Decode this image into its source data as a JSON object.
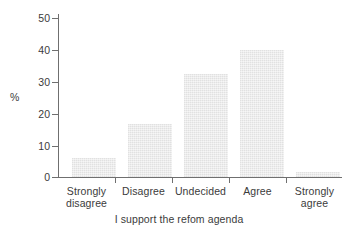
{
  "chart_data": {
    "type": "bar",
    "title": "",
    "subtitle": "",
    "xlabel": "I support the refom agenda",
    "ylabel": "%",
    "categories": [
      "Strongly disagree",
      "Disagree",
      "Undecided",
      "Agree",
      "Strongly agree"
    ],
    "values": [
      6,
      17,
      33,
      40.5,
      1.5
    ],
    "series": [
      {
        "name": "% of respondents",
        "values": [
          6,
          17,
          33,
          40.5,
          1.5
        ]
      }
    ],
    "ylim": [
      0,
      52
    ],
    "xlim": [
      0,
      5
    ],
    "yticks": [
      0,
      10,
      20,
      30,
      40,
      50
    ],
    "ytick_labels": [
      "0",
      "10",
      "20",
      "30",
      "40",
      "50"
    ],
    "grid": false,
    "legend": false,
    "legend_position": "none",
    "bar_color": "#ebebeb",
    "axis_color": "#6f6f6f",
    "text_color": "#3b3b3b",
    "background_color": "#ffffff",
    "annotations": []
  },
  "axes": {
    "y": {
      "title": "%",
      "ticks": [
        {
          "label": "50",
          "value": 50
        },
        {
          "label": "40",
          "value": 40
        },
        {
          "label": "30",
          "value": 30
        },
        {
          "label": "20",
          "value": 20
        },
        {
          "label": "10",
          "value": 10
        },
        {
          "label": "0",
          "value": 0
        }
      ]
    },
    "x": {
      "title": "I support the refom agenda",
      "categories": [
        {
          "line1": "Strongly",
          "line2": "disagree"
        },
        {
          "line1": "Disagree",
          "line2": ""
        },
        {
          "line1": "Undecided",
          "line2": ""
        },
        {
          "line1": "Agree",
          "line2": ""
        },
        {
          "line1": "Strongly",
          "line2": "agree"
        }
      ]
    }
  }
}
